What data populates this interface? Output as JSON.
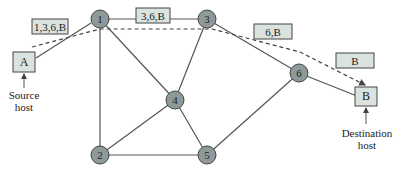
{
  "diagram": {
    "hosts": [
      {
        "id": "A",
        "label": "A",
        "caption_line1": "Source",
        "caption_line2": "host"
      },
      {
        "id": "B",
        "label": "B",
        "caption_line1": "Destination",
        "caption_line2": "host"
      }
    ],
    "routers": [
      {
        "id": "1",
        "label": "1"
      },
      {
        "id": "2",
        "label": "2"
      },
      {
        "id": "3",
        "label": "3"
      },
      {
        "id": "4",
        "label": "4"
      },
      {
        "id": "5",
        "label": "5"
      },
      {
        "id": "6",
        "label": "6"
      }
    ],
    "links": [
      [
        "A",
        "1"
      ],
      [
        "1",
        "3"
      ],
      [
        "1",
        "4"
      ],
      [
        "1",
        "2"
      ],
      [
        "3",
        "4"
      ],
      [
        "3",
        "6"
      ],
      [
        "4",
        "2"
      ],
      [
        "4",
        "5"
      ],
      [
        "2",
        "5"
      ],
      [
        "5",
        "6"
      ],
      [
        "6",
        "B"
      ]
    ],
    "route_labels": [
      {
        "text": "1,3,6,B"
      },
      {
        "text": "3,6,B"
      },
      {
        "text": "6,B"
      },
      {
        "text": "B"
      }
    ],
    "route_path": [
      "A",
      "1",
      "3",
      "6",
      "B"
    ],
    "colors": {
      "router_fill": "#8e9a9a",
      "host_fill": "#dbe3df",
      "line": "#555555"
    }
  }
}
